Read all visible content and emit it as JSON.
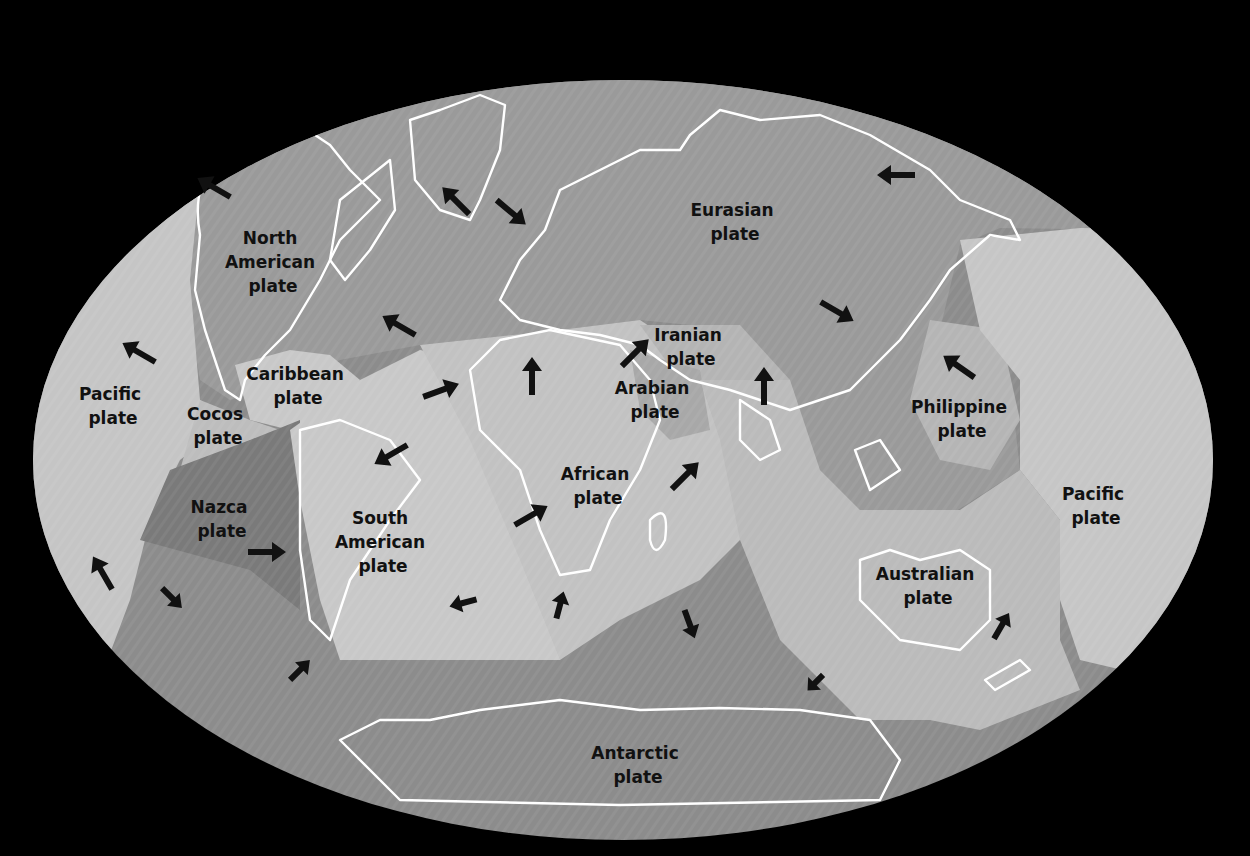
{
  "map": {
    "title": "Tectonic plates of the world",
    "background": "#000000",
    "colors": {
      "ocean_dark": "#8a8a8a",
      "plate_mid": "#9e9e9e",
      "plate_light": "#bdbdbd",
      "plate_lighter": "#cfcfcf",
      "nazca": "#7a7a7a",
      "coastline": "#ffffff",
      "label": "#111111"
    },
    "plates": [
      {
        "id": "north-american",
        "line1": "North",
        "line2": "American",
        "line3": "plate"
      },
      {
        "id": "eurasian",
        "line1": "Eurasian",
        "line2": "plate"
      },
      {
        "id": "pacific-west",
        "line1": "Pacific",
        "line2": "plate"
      },
      {
        "id": "caribbean",
        "line1": "Caribbean",
        "line2": "plate"
      },
      {
        "id": "cocos",
        "line1": "Cocos",
        "line2": "plate"
      },
      {
        "id": "iranian",
        "line1": "Iranian",
        "line2": "plate"
      },
      {
        "id": "arabian",
        "line1": "Arabian",
        "line2": "plate"
      },
      {
        "id": "philippine",
        "line1": "Philippine",
        "line2": "plate"
      },
      {
        "id": "african",
        "line1": "African",
        "line2": "plate"
      },
      {
        "id": "nazca",
        "line1": "Nazca",
        "line2": "plate"
      },
      {
        "id": "south-american",
        "line1": "South",
        "line2": "American",
        "line3": "plate"
      },
      {
        "id": "pacific-east",
        "line1": "Pacific",
        "line2": "plate"
      },
      {
        "id": "australian",
        "line1": "Australian",
        "line2": "plate"
      },
      {
        "id": "antarctic",
        "line1": "Antarctic",
        "line2": "plate"
      }
    ]
  }
}
